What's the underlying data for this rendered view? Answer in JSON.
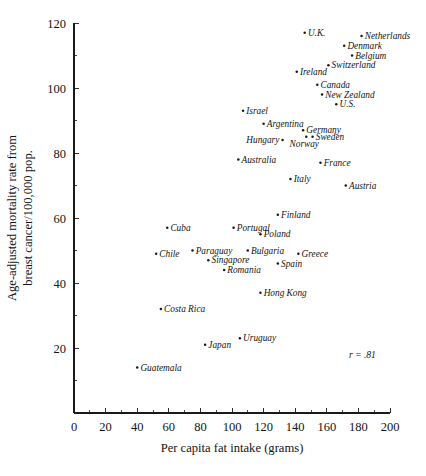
{
  "chart_data": {
    "type": "scatter",
    "title": "",
    "xlabel": "Per capita fat intake (grams)",
    "ylabel_line1": "Age-adjusted mortality rate from",
    "ylabel_line2": "breast cancer/100,000 pop.",
    "xlim": [
      0,
      200
    ],
    "ylim": [
      0,
      120
    ],
    "xticks": [
      0,
      20,
      40,
      60,
      80,
      100,
      120,
      140,
      160,
      180,
      200
    ],
    "xtick_labels": [
      "0",
      "20",
      "40",
      "60",
      "80",
      "100",
      "120",
      "140",
      "160",
      "180",
      "200"
    ],
    "xminor_step": 10,
    "yticks": [
      20,
      40,
      60,
      80,
      100,
      120
    ],
    "ytick_labels": [
      "20",
      "40",
      "60",
      "80",
      "100",
      "120"
    ],
    "yminor_step": 10,
    "grid": false,
    "legend": "none",
    "annotation": "r = .81",
    "annotation_x": 174,
    "annotation_y": 17,
    "points": [
      {
        "label": "U.K.",
        "x": 146,
        "y": 117,
        "label_side": "right"
      },
      {
        "label": "Netherlands",
        "x": 182,
        "y": 116,
        "label_side": "right"
      },
      {
        "label": "Denmark",
        "x": 171,
        "y": 113,
        "label_side": "right"
      },
      {
        "label": "Belgium",
        "x": 176,
        "y": 110,
        "label_side": "right"
      },
      {
        "label": "Switzerland",
        "x": 161,
        "y": 107,
        "label_side": "right"
      },
      {
        "label": "Ireland",
        "x": 141,
        "y": 105,
        "label_side": "right"
      },
      {
        "label": "Canada",
        "x": 154,
        "y": 101,
        "label_side": "right"
      },
      {
        "label": "New Zealand",
        "x": 157,
        "y": 98,
        "label_side": "right"
      },
      {
        "label": "U.S.",
        "x": 166,
        "y": 95,
        "label_side": "right"
      },
      {
        "label": "Israel",
        "x": 107,
        "y": 93,
        "label_side": "right"
      },
      {
        "label": "Argentina",
        "x": 120,
        "y": 89,
        "label_side": "right"
      },
      {
        "label": "Germany",
        "x": 145,
        "y": 87,
        "label_side": "right"
      },
      {
        "label": "Hungary",
        "x": 132,
        "y": 84,
        "label_side": "left"
      },
      {
        "label": "Sweden",
        "x": 151,
        "y": 85,
        "label_side": "right"
      },
      {
        "label": "Norway",
        "x": 147,
        "y": 85,
        "label_side": "below"
      },
      {
        "label": "Australia",
        "x": 104,
        "y": 78,
        "label_side": "right"
      },
      {
        "label": "France",
        "x": 156,
        "y": 77,
        "label_side": "right"
      },
      {
        "label": "Italy",
        "x": 137,
        "y": 72,
        "label_side": "right"
      },
      {
        "label": "Austria",
        "x": 172,
        "y": 70,
        "label_side": "right"
      },
      {
        "label": "Finland",
        "x": 129,
        "y": 61,
        "label_side": "right"
      },
      {
        "label": "Cuba",
        "x": 59,
        "y": 57,
        "label_side": "right"
      },
      {
        "label": "Portugal",
        "x": 101,
        "y": 57,
        "label_side": "right"
      },
      {
        "label": "Poland",
        "x": 118,
        "y": 55,
        "label_side": "right"
      },
      {
        "label": "Chile",
        "x": 52,
        "y": 49,
        "label_side": "right"
      },
      {
        "label": "Paraguay",
        "x": 75,
        "y": 50,
        "label_side": "right"
      },
      {
        "label": "Bulgaria",
        "x": 110,
        "y": 50,
        "label_side": "right"
      },
      {
        "label": "Greece",
        "x": 142,
        "y": 49,
        "label_side": "right"
      },
      {
        "label": "Singapore",
        "x": 85,
        "y": 47,
        "label_side": "right"
      },
      {
        "label": "Spain",
        "x": 129,
        "y": 46,
        "label_side": "right"
      },
      {
        "label": "Romania",
        "x": 95,
        "y": 44,
        "label_side": "right"
      },
      {
        "label": "Hong Kong",
        "x": 118,
        "y": 37,
        "label_side": "right"
      },
      {
        "label": "Costa Rica",
        "x": 55,
        "y": 32,
        "label_side": "right"
      },
      {
        "label": "Uruguay",
        "x": 105,
        "y": 23,
        "label_side": "right"
      },
      {
        "label": "Japan",
        "x": 83,
        "y": 21,
        "label_side": "right"
      },
      {
        "label": "Guatemala",
        "x": 40,
        "y": 14,
        "label_side": "right"
      }
    ]
  }
}
